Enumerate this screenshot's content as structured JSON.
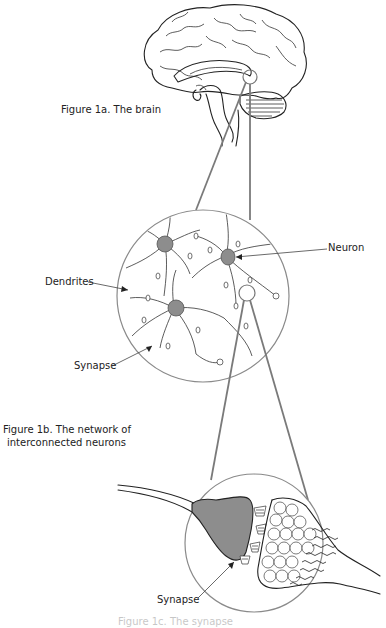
{
  "figures": {
    "brain": {
      "caption": "Figure 1a. The brain"
    },
    "network": {
      "caption_line1": "Figure 1b. The network of",
      "caption_line2": "interconnected neurons",
      "labels": {
        "dendrites": "Dendrites",
        "neuron": "Neuron",
        "synapse": "Synapse"
      }
    },
    "synapse_detail": {
      "labels": {
        "synapse": "Synapse"
      },
      "caption": "Figure 1c. The synapse"
    }
  },
  "colors": {
    "line": "#222222",
    "connector": "#7a7a7a",
    "cell_body": "#8d8d8d",
    "background": "#ffffff"
  }
}
